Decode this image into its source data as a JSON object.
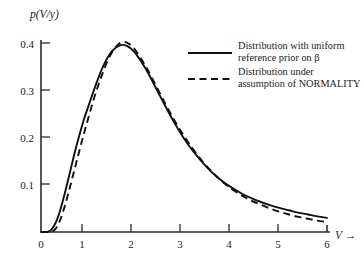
{
  "figure": {
    "y_axis_title": "p(V/y)",
    "x_axis_title": "V →"
  },
  "axes": {
    "x_ticks": [
      "0",
      "1",
      "2",
      "3",
      "4",
      "5",
      "6"
    ],
    "y_ticks": [
      "0.1",
      "0.2",
      "0.3",
      "0.4"
    ]
  },
  "legend": {
    "entries": [
      {
        "style": "solid",
        "line1": "Distribution with uniform",
        "line2": "reference prior on β"
      },
      {
        "style": "dashed",
        "line1": "Distribution under",
        "line2": "assumption of NORMALITY"
      }
    ]
  },
  "chart_data": {
    "type": "line",
    "title": "",
    "xlabel": "V →",
    "ylabel": "p(V/y)",
    "xlim": [
      0,
      6
    ],
    "ylim": [
      0,
      0.42
    ],
    "xticks": [
      0,
      1,
      2,
      3,
      4,
      5,
      6
    ],
    "yticks": [
      0.1,
      0.2,
      0.3,
      0.4
    ],
    "grid": false,
    "legend_position": "upper-right-inside",
    "x": [
      0.0,
      0.1,
      0.2,
      0.3,
      0.4,
      0.5,
      0.6,
      0.7,
      0.8,
      0.9,
      1.0,
      1.1,
      1.2,
      1.3,
      1.4,
      1.5,
      1.6,
      1.7,
      1.8,
      1.9,
      2.0,
      2.2,
      2.4,
      2.6,
      2.8,
      3.0,
      3.2,
      3.4,
      3.6,
      3.8,
      4.0,
      4.2,
      4.4,
      4.6,
      4.8,
      5.0,
      5.2,
      5.4,
      5.6,
      5.8,
      6.0
    ],
    "series": [
      {
        "name": "Distribution with uniform reference prior on β",
        "style": "solid",
        "values": [
          0.0,
          0.0,
          0.003,
          0.018,
          0.045,
          0.082,
          0.123,
          0.165,
          0.203,
          0.238,
          0.268,
          0.297,
          0.325,
          0.35,
          0.37,
          0.384,
          0.392,
          0.396,
          0.394,
          0.387,
          0.376,
          0.345,
          0.307,
          0.268,
          0.231,
          0.198,
          0.17,
          0.146,
          0.125,
          0.108,
          0.094,
          0.082,
          0.072,
          0.064,
          0.057,
          0.051,
          0.046,
          0.041,
          0.037,
          0.033,
          0.03
        ]
      },
      {
        "name": "Distribution under assumption of NORMALITY",
        "style": "dashed",
        "values": [
          0.0,
          0.0,
          0.0,
          0.006,
          0.025,
          0.055,
          0.092,
          0.131,
          0.17,
          0.208,
          0.244,
          0.279,
          0.31,
          0.338,
          0.363,
          0.382,
          0.395,
          0.402,
          0.401,
          0.394,
          0.382,
          0.35,
          0.312,
          0.273,
          0.236,
          0.203,
          0.174,
          0.148,
          0.126,
          0.107,
          0.091,
          0.078,
          0.067,
          0.058,
          0.05,
          0.043,
          0.037,
          0.032,
          0.028,
          0.024,
          0.021
        ]
      }
    ]
  }
}
